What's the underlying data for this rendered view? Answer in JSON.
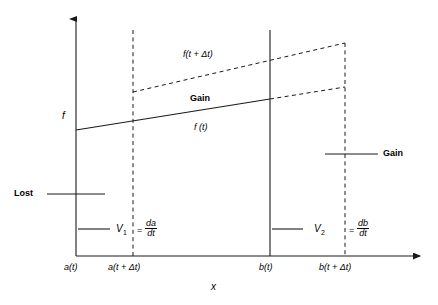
{
  "figure": {
    "axes": {
      "y_label": "f",
      "x_label": "x"
    },
    "x_ticks": [
      {
        "id": "a_t",
        "label": "a(t)"
      },
      {
        "id": "a_t_dt",
        "label": "a(t + Δt)"
      },
      {
        "id": "b_t",
        "label": "b(t)"
      },
      {
        "id": "b_t_dt",
        "label": "b(t + Δt)"
      }
    ],
    "curves": [
      {
        "id": "f_t",
        "label": "f (t)",
        "style": "solid"
      },
      {
        "id": "f_t_dt",
        "label": "f(t + Δt)",
        "style": "dashed"
      }
    ],
    "annotations": [
      {
        "id": "gain_center",
        "label": "Gain",
        "emphasis": "bold"
      },
      {
        "id": "gain_right",
        "label": "Gain",
        "emphasis": "bold"
      },
      {
        "id": "lost_left",
        "label": "Lost",
        "emphasis": "bold"
      }
    ],
    "velocities": [
      {
        "id": "v1",
        "symbol": "V",
        "subscript": "1",
        "equals": "=",
        "numerator": "da",
        "denominator": "dt"
      },
      {
        "id": "v2",
        "symbol": "V",
        "subscript": "2",
        "equals": "=",
        "numerator": "db",
        "denominator": "dt"
      }
    ],
    "colors": {
      "stroke": "#1a1a1a",
      "background": "#ffffff"
    }
  }
}
